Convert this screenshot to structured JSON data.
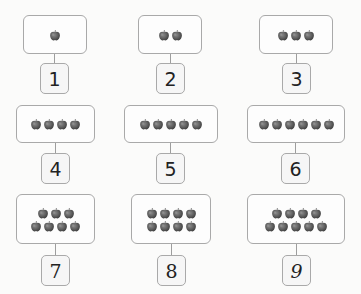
{
  "header": {
    "note": "heading text cropped at top edge; not legible"
  },
  "colors": {
    "card_border": "#a9a9a9",
    "apple": "#5e5e5e",
    "number_text": "#222222",
    "background": "#fbfbfa"
  },
  "icon": "apple-icon",
  "items": [
    {
      "number": "1",
      "apples": [
        1
      ],
      "card": {
        "x": 23,
        "y": 15,
        "w": 64,
        "h": 39
      },
      "num": {
        "x": 40,
        "y": 63
      }
    },
    {
      "number": "2",
      "apples": [
        2
      ],
      "card": {
        "x": 138,
        "y": 15,
        "w": 64,
        "h": 39
      },
      "num": {
        "x": 156,
        "y": 63
      }
    },
    {
      "number": "3",
      "apples": [
        3
      ],
      "card": {
        "x": 259,
        "y": 15,
        "w": 74,
        "h": 39
      },
      "num": {
        "x": 282,
        "y": 63
      }
    },
    {
      "number": "4",
      "apples": [
        4
      ],
      "card": {
        "x": 16,
        "y": 105,
        "w": 79,
        "h": 38
      },
      "num": {
        "x": 41,
        "y": 153
      }
    },
    {
      "number": "5",
      "apples": [
        5
      ],
      "card": {
        "x": 124,
        "y": 105,
        "w": 94,
        "h": 38
      },
      "num": {
        "x": 156,
        "y": 153
      }
    },
    {
      "number": "6",
      "apples": [
        6
      ],
      "card": {
        "x": 247,
        "y": 105,
        "w": 98,
        "h": 38
      },
      "num": {
        "x": 281,
        "y": 153
      }
    },
    {
      "number": "7",
      "apples": [
        3,
        4
      ],
      "card": {
        "x": 16,
        "y": 194,
        "w": 79,
        "h": 50
      },
      "num": {
        "x": 41,
        "y": 255
      },
      "serif": true
    },
    {
      "number": "8",
      "apples": [
        4,
        4
      ],
      "card": {
        "x": 131,
        "y": 194,
        "w": 80,
        "h": 50
      },
      "num": {
        "x": 157,
        "y": 255
      },
      "serif": true
    },
    {
      "number": "9",
      "apples": [
        4,
        5
      ],
      "card": {
        "x": 247,
        "y": 194,
        "w": 98,
        "h": 50
      },
      "num": {
        "x": 282,
        "y": 255
      },
      "script": true
    }
  ]
}
